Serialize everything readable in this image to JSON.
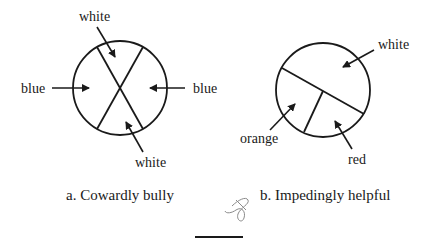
{
  "figure_a": {
    "caption": "a. Cowardly bully",
    "labels": {
      "top": "white",
      "left": "blue",
      "right": "blue",
      "bottom": "white"
    }
  },
  "figure_b": {
    "caption": "b. Impedingly helpful",
    "labels": {
      "top_right": "white",
      "bottom_left": "orange",
      "bottom_right": "red"
    }
  },
  "colors": {
    "ink": "#1a1a1a",
    "background": "#ffffff"
  }
}
